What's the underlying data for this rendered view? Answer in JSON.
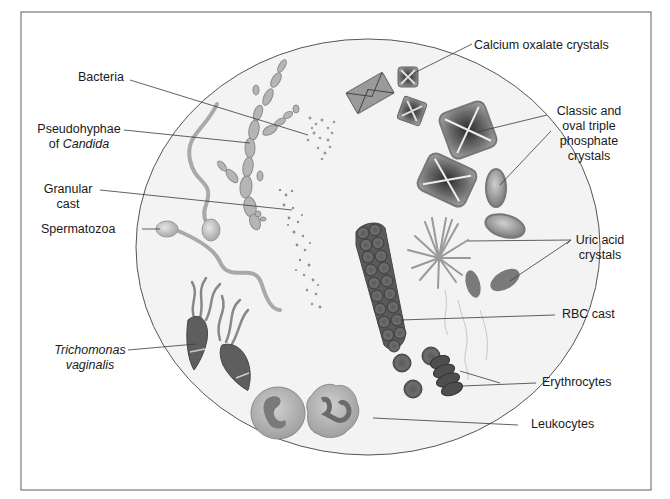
{
  "figure": {
    "frame_color": "#7a7a7a",
    "field_fill": "#f3f3f3",
    "field_stroke": "#555555",
    "leader_color": "#3a3a3a"
  },
  "labels": {
    "bacteria": "Bacteria",
    "pseudohyphae_line1": "Pseudohyphae",
    "pseudohyphae_line2_prefix": "of ",
    "pseudohyphae_line2_italic": "Candida",
    "granular_line1": "Granular",
    "granular_line2": "cast",
    "spermatozoa": "Spermatozoa",
    "trichomonas_line1": "Trichomonas",
    "trichomonas_line2": "vaginalis",
    "calcium_oxalate": "Calcium oxalate crystals",
    "triple_phosphate_line1": "Classic and",
    "triple_phosphate_line2": "oval triple",
    "triple_phosphate_line3": "phosphate",
    "triple_phosphate_line4": "crystals",
    "uric_acid_line1": "Uric acid",
    "uric_acid_line2": "crystals",
    "rbc_cast": "RBC cast",
    "erythrocytes": "Erythrocytes",
    "leukocytes": "Leukocytes"
  }
}
